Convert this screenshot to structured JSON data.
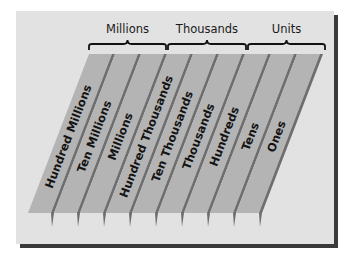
{
  "diagram": {
    "type": "place-value-chart",
    "groups": [
      {
        "label": "Millions",
        "x1": 89,
        "x2": 166
      },
      {
        "label": "Thousands",
        "x1": 168,
        "x2": 246
      },
      {
        "label": "Units",
        "x1": 248,
        "x2": 325
      }
    ],
    "places": [
      {
        "label": "Hundred Millions"
      },
      {
        "label": "Ten Millions"
      },
      {
        "label": "Millions"
      },
      {
        "label": "Hundred Thousands"
      },
      {
        "label": "Ten Thousands"
      },
      {
        "label": "Thousands"
      },
      {
        "label": "Hundreds"
      },
      {
        "label": "Tens"
      },
      {
        "label": "Ones"
      }
    ],
    "colors": {
      "panel": "#e2e2e2",
      "strip_face": "#b4b4b4",
      "strip_edge": "#6e6e6e",
      "shadow": "#3a3a3a",
      "text": "#141414"
    }
  }
}
